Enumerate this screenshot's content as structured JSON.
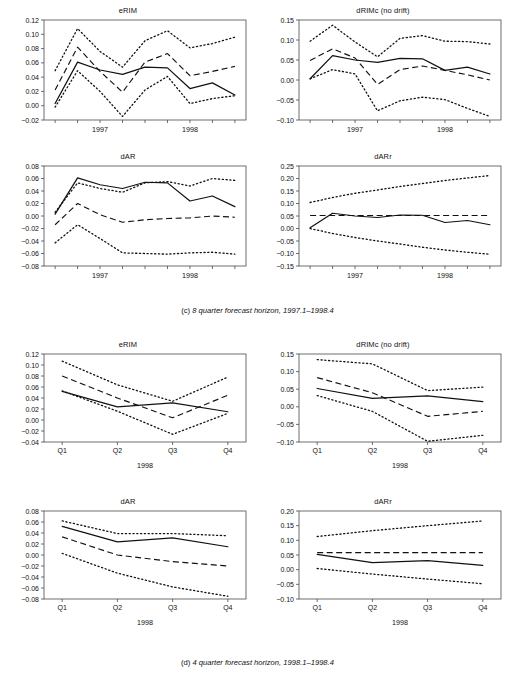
{
  "figure": {
    "panels_c": [
      "eRIM",
      "dRIMc (no drift)",
      "dAR",
      "dARr"
    ],
    "panels_d": [
      "eRIM",
      "dRIMc (no drift)",
      "dAR",
      "dARr"
    ],
    "caption_c_label": "(c)",
    "caption_c_text": "8 quarter forecast horizon, 1997.1–1998.4",
    "caption_d_label": "(d)",
    "caption_d_text": "4 quarter forecast horizon, 1998.1–1998.4"
  },
  "chart_data": [
    {
      "id": "c-erim",
      "type": "line",
      "title": "eRIM",
      "xlabel": "",
      "ylabel": "",
      "x": [
        1,
        2,
        3,
        4,
        5,
        6,
        7,
        8
      ],
      "xtick_labels": [
        "",
        "1997",
        "",
        "",
        "",
        "1998",
        "",
        ""
      ],
      "xtick_years": [
        "1997",
        "1998"
      ],
      "ylim": [
        -0.02,
        0.12
      ],
      "yticks": [
        -0.02,
        0.0,
        0.02,
        0.04,
        0.06,
        0.08,
        0.1,
        0.12
      ],
      "ytick_labels": [
        "-0.02",
        "0.00",
        "0.02",
        "0.04",
        "0.06",
        "0.08",
        "0.10",
        "0.12"
      ],
      "grid": false,
      "legend": "none",
      "series": [
        {
          "name": "actual",
          "style": "solid",
          "values": [
            0.003,
            0.061,
            0.05,
            0.044,
            0.054,
            0.053,
            0.024,
            0.032,
            0.015
          ]
        },
        {
          "name": "forecast",
          "style": "dashed",
          "values": [
            0.022,
            0.082,
            0.048,
            0.019,
            0.061,
            0.073,
            0.042,
            0.048,
            0.055
          ]
        },
        {
          "name": "upper-band",
          "style": "dotted",
          "values": [
            0.049,
            0.108,
            0.076,
            0.054,
            0.091,
            0.105,
            0.081,
            0.087,
            0.096
          ]
        },
        {
          "name": "lower-band",
          "style": "dotted",
          "values": [
            -0.002,
            0.049,
            0.02,
            -0.015,
            0.022,
            0.041,
            0.003,
            0.01,
            0.014
          ]
        }
      ]
    },
    {
      "id": "c-drimc",
      "type": "line",
      "title": "dRIMc (no drift)",
      "xlabel": "",
      "ylabel": "",
      "x": [
        1,
        2,
        3,
        4,
        5,
        6,
        7,
        8
      ],
      "xtick_years": [
        "1997",
        "1998"
      ],
      "ylim": [
        -0.1,
        0.15
      ],
      "yticks": [
        -0.1,
        -0.05,
        0.0,
        0.05,
        0.1,
        0.15
      ],
      "ytick_labels": [
        "-0.10",
        "-0.05",
        "0.00",
        "0.05",
        "0.10",
        "0.15"
      ],
      "grid": false,
      "legend": "none",
      "series": [
        {
          "name": "actual",
          "style": "solid",
          "values": [
            0.003,
            0.061,
            0.05,
            0.044,
            0.054,
            0.053,
            0.024,
            0.032,
            0.015
          ]
        },
        {
          "name": "forecast",
          "style": "dashed",
          "values": [
            0.049,
            0.078,
            0.055,
            -0.011,
            0.026,
            0.035,
            0.024,
            0.013,
            0.0
          ]
        },
        {
          "name": "upper-band",
          "style": "dotted",
          "values": [
            0.097,
            0.137,
            0.095,
            0.058,
            0.104,
            0.111,
            0.097,
            0.096,
            0.09
          ]
        },
        {
          "name": "lower-band",
          "style": "dotted",
          "values": [
            0.003,
            0.026,
            0.015,
            -0.077,
            -0.052,
            -0.043,
            -0.049,
            -0.071,
            -0.091
          ]
        }
      ]
    },
    {
      "id": "c-dar",
      "type": "line",
      "title": "dAR",
      "xlabel": "",
      "ylabel": "",
      "x": [
        1,
        2,
        3,
        4,
        5,
        6,
        7,
        8
      ],
      "xtick_years": [
        "1997",
        "1998"
      ],
      "ylim": [
        -0.08,
        0.08
      ],
      "yticks": [
        -0.08,
        -0.06,
        -0.04,
        -0.02,
        0.0,
        0.02,
        0.04,
        0.06,
        0.08
      ],
      "ytick_labels": [
        "-0.08",
        "-0.06",
        "-0.04",
        "-0.02",
        "0.00",
        "0.02",
        "0.04",
        "0.06",
        "0.08"
      ],
      "grid": false,
      "legend": "none",
      "series": [
        {
          "name": "actual",
          "style": "solid",
          "values": [
            0.003,
            0.061,
            0.05,
            0.044,
            0.054,
            0.053,
            0.024,
            0.032,
            0.015
          ]
        },
        {
          "name": "forecast",
          "style": "dashed",
          "values": [
            -0.014,
            0.02,
            0.002,
            -0.01,
            -0.006,
            -0.004,
            -0.003,
            0.0,
            -0.002
          ]
        },
        {
          "name": "upper-band",
          "style": "dotted",
          "values": [
            0.006,
            0.053,
            0.044,
            0.038,
            0.053,
            0.055,
            0.048,
            0.06,
            0.057
          ]
        },
        {
          "name": "lower-band",
          "style": "dotted",
          "values": [
            -0.043,
            -0.014,
            -0.036,
            -0.059,
            -0.06,
            -0.061,
            -0.059,
            -0.058,
            -0.061
          ]
        }
      ]
    },
    {
      "id": "c-darr",
      "type": "line",
      "title": "dARr",
      "xlabel": "",
      "ylabel": "",
      "x": [
        1,
        2,
        3,
        4,
        5,
        6,
        7,
        8
      ],
      "xtick_years": [
        "1997",
        "1998"
      ],
      "ylim": [
        -0.15,
        0.25
      ],
      "yticks": [
        -0.15,
        -0.1,
        -0.05,
        0.0,
        0.05,
        0.1,
        0.15,
        0.2,
        0.25
      ],
      "ytick_labels": [
        "-0.15",
        "-0.10",
        "-0.05",
        "0.00",
        "0.05",
        "0.10",
        "0.15",
        "0.20",
        "0.25"
      ],
      "grid": false,
      "legend": "none",
      "series": [
        {
          "name": "actual",
          "style": "solid",
          "values": [
            0.003,
            0.061,
            0.05,
            0.044,
            0.054,
            0.053,
            0.024,
            0.032,
            0.015
          ]
        },
        {
          "name": "forecast",
          "style": "dashed",
          "values": [
            0.052,
            0.052,
            0.052,
            0.052,
            0.052,
            0.052,
            0.052,
            0.052,
            0.052
          ]
        },
        {
          "name": "upper-band",
          "style": "dotted",
          "values": [
            0.104,
            0.124,
            0.141,
            0.154,
            0.168,
            0.18,
            0.192,
            0.202,
            0.212
          ]
        },
        {
          "name": "lower-band",
          "style": "dotted",
          "values": [
            0.0,
            -0.02,
            -0.036,
            -0.05,
            -0.062,
            -0.075,
            -0.086,
            -0.095,
            -0.103
          ]
        }
      ]
    },
    {
      "id": "d-erim",
      "type": "line",
      "title": "eRIM",
      "xlabel": "1998",
      "ylabel": "",
      "x": [
        "Q1",
        "Q2",
        "Q3",
        "Q4"
      ],
      "xtick_labels": [
        "Q1",
        "Q2",
        "Q3",
        "Q4"
      ],
      "ylim": [
        -0.04,
        0.12
      ],
      "yticks": [
        -0.04,
        -0.02,
        0.0,
        0.02,
        0.04,
        0.06,
        0.08,
        0.1,
        0.12
      ],
      "ytick_labels": [
        "-0.04",
        "-0.02",
        "0.00",
        "0.02",
        "0.04",
        "0.06",
        "0.08",
        "0.10",
        "0.12"
      ],
      "grid": false,
      "legend": "none",
      "series": [
        {
          "name": "actual",
          "style": "solid",
          "values": [
            0.052,
            0.024,
            0.031,
            0.015
          ]
        },
        {
          "name": "forecast",
          "style": "dashed",
          "values": [
            0.08,
            0.04,
            0.004,
            0.045
          ]
        },
        {
          "name": "upper-band",
          "style": "dotted",
          "values": [
            0.107,
            0.064,
            0.034,
            0.078
          ]
        },
        {
          "name": "lower-band",
          "style": "dotted",
          "values": [
            0.053,
            0.016,
            -0.026,
            0.012
          ]
        }
      ]
    },
    {
      "id": "d-drimc",
      "type": "line",
      "title": "dRIMc (no drift)",
      "xlabel": "1998",
      "ylabel": "",
      "x": [
        "Q1",
        "Q2",
        "Q3",
        "Q4"
      ],
      "xtick_labels": [
        "Q1",
        "Q2",
        "Q3",
        "Q4"
      ],
      "ylim": [
        -0.1,
        0.15
      ],
      "yticks": [
        -0.1,
        -0.05,
        0.0,
        0.05,
        0.1,
        0.15
      ],
      "ytick_labels": [
        "-0.10",
        "-0.05",
        "0.00",
        "0.05",
        "0.10",
        "0.15"
      ],
      "grid": false,
      "legend": "none",
      "series": [
        {
          "name": "actual",
          "style": "solid",
          "values": [
            0.052,
            0.024,
            0.031,
            0.015
          ]
        },
        {
          "name": "forecast",
          "style": "dashed",
          "values": [
            0.083,
            0.04,
            -0.027,
            -0.013
          ]
        },
        {
          "name": "upper-band",
          "style": "dotted",
          "values": [
            0.134,
            0.122,
            0.046,
            0.056
          ]
        },
        {
          "name": "lower-band",
          "style": "dotted",
          "values": [
            0.032,
            -0.013,
            -0.098,
            -0.081
          ]
        }
      ]
    },
    {
      "id": "d-dar",
      "type": "line",
      "title": "dAR",
      "xlabel": "1998",
      "ylabel": "",
      "x": [
        "Q1",
        "Q2",
        "Q3",
        "Q4"
      ],
      "xtick_labels": [
        "Q1",
        "Q2",
        "Q3",
        "Q4"
      ],
      "ylim": [
        -0.08,
        0.08
      ],
      "yticks": [
        -0.08,
        -0.06,
        -0.04,
        -0.02,
        0.0,
        0.02,
        0.04,
        0.06,
        0.08
      ],
      "ytick_labels": [
        "-0.08",
        "-0.06",
        "-0.04",
        "-0.02",
        "0.00",
        "0.02",
        "0.04",
        "0.06",
        "0.08"
      ],
      "grid": false,
      "legend": "none",
      "series": [
        {
          "name": "actual",
          "style": "solid",
          "values": [
            0.052,
            0.024,
            0.031,
            0.015
          ]
        },
        {
          "name": "forecast",
          "style": "dashed",
          "values": [
            0.033,
            0.0,
            -0.012,
            -0.02
          ]
        },
        {
          "name": "upper-band",
          "style": "dotted",
          "values": [
            0.062,
            0.039,
            0.039,
            0.035
          ]
        },
        {
          "name": "lower-band",
          "style": "dotted",
          "values": [
            0.003,
            -0.033,
            -0.058,
            -0.075
          ]
        }
      ]
    },
    {
      "id": "d-darr",
      "type": "line",
      "title": "dARr",
      "xlabel": "1998",
      "ylabel": "",
      "x": [
        "Q1",
        "Q2",
        "Q3",
        "Q4"
      ],
      "xtick_labels": [
        "Q1",
        "Q2",
        "Q3",
        "Q4"
      ],
      "ylim": [
        -0.1,
        0.2
      ],
      "yticks": [
        -0.1,
        -0.05,
        0.0,
        0.05,
        0.1,
        0.15,
        0.2
      ],
      "ytick_labels": [
        "-0.10",
        "-0.05",
        "0.00",
        "0.05",
        "0.10",
        "0.15",
        "0.20"
      ],
      "grid": false,
      "legend": "none",
      "series": [
        {
          "name": "actual",
          "style": "solid",
          "values": [
            0.052,
            0.024,
            0.031,
            0.015
          ]
        },
        {
          "name": "forecast",
          "style": "dashed",
          "values": [
            0.058,
            0.058,
            0.058,
            0.058
          ]
        },
        {
          "name": "upper-band",
          "style": "dotted",
          "values": [
            0.113,
            0.133,
            0.15,
            0.166
          ]
        },
        {
          "name": "lower-band",
          "style": "dotted",
          "values": [
            0.004,
            -0.015,
            -0.032,
            -0.048
          ]
        }
      ]
    }
  ]
}
